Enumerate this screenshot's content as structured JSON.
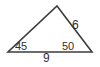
{
  "figure": {
    "kind": "triangle-diagram",
    "stroke_color": "#3d3d3d",
    "text_color": "#2f2f2f",
    "background_color": "#ffffff",
    "vertices": {
      "apex": [
        57,
        6
      ],
      "bottom_left": [
        8,
        52
      ],
      "bottom_right": [
        92,
        52
      ]
    },
    "labels": {
      "angle_left": "45",
      "angle_right": "50",
      "side_right": "6",
      "side_bottom": "9"
    }
  },
  "chart_data": {
    "type": "diagram",
    "title": "",
    "xlabel": "",
    "ylabel": "",
    "shape": "triangle",
    "angles": [
      {
        "vertex": "bottom-left",
        "label": "45",
        "units": "degrees"
      },
      {
        "vertex": "bottom-right",
        "label": "50",
        "units": "degrees"
      }
    ],
    "sides": [
      {
        "position": "right",
        "label": "6"
      },
      {
        "position": "bottom",
        "label": "9"
      }
    ],
    "annotations": [
      "45",
      "50",
      "6",
      "9"
    ]
  }
}
